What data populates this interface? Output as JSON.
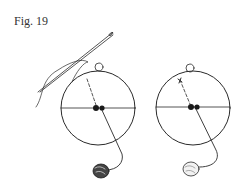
{
  "figure": {
    "label": "Fig. 19",
    "ink_color": "#2a2a2a",
    "background": "#ffffff"
  },
  "diagrams": [
    {
      "name": "left",
      "elements": [
        "needle",
        "thread",
        "circle",
        "horizontal-diameter",
        "dashed-line",
        "two-dots",
        "small-top-circle",
        "solid-line",
        "yarn-ball-dark"
      ]
    },
    {
      "name": "right",
      "elements": [
        "circle",
        "horizontal-diameter",
        "dashed-line",
        "cross-mark",
        "two-dots",
        "small-top-circle",
        "solid-line",
        "yarn-ball-light"
      ]
    }
  ]
}
